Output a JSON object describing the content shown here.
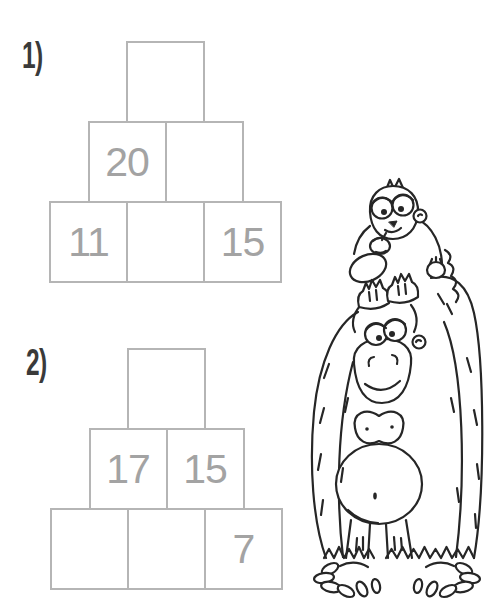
{
  "colors": {
    "background": "#ffffff",
    "box_border": "#b5b5b5",
    "number_text": "#a3a3a3",
    "label_text": "#3a3a3a",
    "line_art": "#262626"
  },
  "pyramids": [
    {
      "label": "1)",
      "rows": [
        {
          "cells": [
            ""
          ]
        },
        {
          "cells": [
            "20",
            ""
          ]
        },
        {
          "cells": [
            "11",
            "",
            "15"
          ]
        }
      ]
    },
    {
      "label": "2)",
      "rows": [
        {
          "cells": [
            ""
          ]
        },
        {
          "cells": [
            "17",
            "15"
          ]
        },
        {
          "cells": [
            "",
            "",
            "7"
          ]
        }
      ]
    }
  ],
  "illustration": {
    "name": "gorilla-with-baby-monkey"
  }
}
